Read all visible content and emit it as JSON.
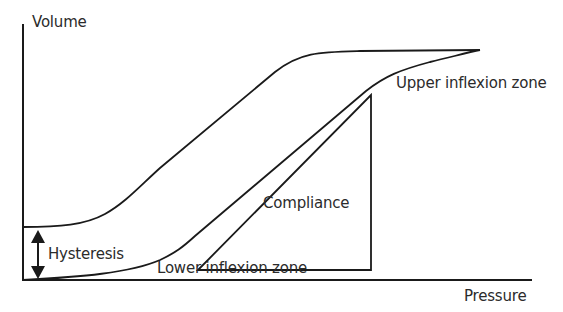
{
  "diagram": {
    "type": "pressure-volume hysteresis loop",
    "axes": {
      "y_label": "Volume",
      "x_label": "Pressure"
    },
    "labels": {
      "upper_inflexion": "Upper inflexion zone",
      "lower_inflexion": "Lower inflexion zone",
      "compliance": "Compliance",
      "hysteresis": "Hysteresis"
    },
    "curves": [
      {
        "name": "deflation-curve",
        "description": "Upper limb of loop, starts at higher volume on the left"
      },
      {
        "name": "inflation-curve",
        "description": "Lower limb of loop, starts at origin"
      }
    ],
    "annotations": [
      {
        "name": "compliance-triangle",
        "description": "Right triangle whose hypotenuse is parallel to the steep linear segment of the inflation curve"
      },
      {
        "name": "hysteresis-arrow",
        "description": "Double-headed vertical arrow between the two limbs at zero pressure"
      }
    ],
    "colors": {
      "line": "#1a1a1a",
      "text": "#2b2b2b",
      "background": "#ffffff"
    }
  }
}
